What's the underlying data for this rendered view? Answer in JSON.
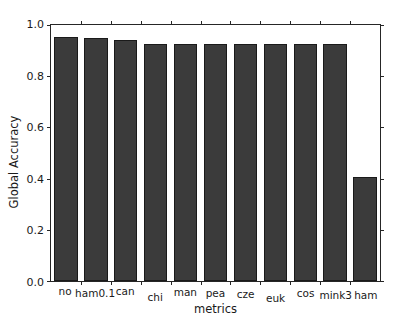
{
  "chart_data": {
    "type": "bar",
    "title": "",
    "xlabel": "metrics",
    "ylabel": "Global Accuracy",
    "categories": [
      "no",
      "ham0.1",
      "can",
      "chi",
      "man",
      "pea",
      "cze",
      "euk",
      "cos",
      "mink3",
      "ham"
    ],
    "values": [
      0.955,
      0.948,
      0.941,
      0.925,
      0.925,
      0.925,
      0.925,
      0.925,
      0.925,
      0.925,
      0.405
    ],
    "ylim": [
      0.0,
      1.0
    ],
    "yticks": [
      0.0,
      0.2,
      0.4,
      0.6,
      0.8,
      1.0
    ],
    "ytick_labels": [
      "0.0",
      "0.2",
      "0.4",
      "0.6",
      "0.8",
      "1.0"
    ],
    "grid": false,
    "legend": null,
    "bar_color": "#3b3b3b",
    "edge_color": "#1a1a1a",
    "axis_color": "#262626"
  }
}
